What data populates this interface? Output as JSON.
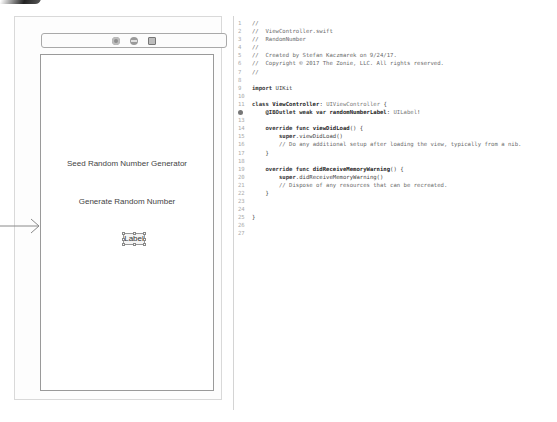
{
  "storyboard": {
    "scene_dock": {
      "icons": [
        "view-controller-icon",
        "first-responder-icon",
        "exit-icon"
      ]
    },
    "scene": {
      "buttons": [
        {
          "label": "Seed Random Number Generator"
        },
        {
          "label": "Generate Random Number"
        }
      ],
      "label": {
        "text": "Label"
      }
    },
    "entry_point": "initial-view-controller-arrow"
  },
  "editor": {
    "file_name": "ViewController.swift",
    "lines": [
      {
        "n": "1",
        "text": "//"
      },
      {
        "n": "2",
        "text": "//  ViewController.swift"
      },
      {
        "n": "3",
        "text": "//  RandomNumber"
      },
      {
        "n": "4",
        "text": "//"
      },
      {
        "n": "5",
        "text": "//  Created by Stefan Kaczmarek on 9/24/17."
      },
      {
        "n": "6",
        "text": "//  Copyright © 2017 The Zonie, LLC. All rights reserved."
      },
      {
        "n": "7",
        "text": "//"
      },
      {
        "n": "8",
        "text": ""
      },
      {
        "n": "9",
        "kw": "import",
        "rest": " UIKit"
      },
      {
        "n": "10",
        "text": ""
      },
      {
        "n": "11",
        "kw": "class",
        "name": " ViewController",
        "rest": ": ",
        "type": "UIViewController",
        "tail": " {"
      },
      {
        "n": "12",
        "outlet": true,
        "indent": "    ",
        "kw": "@IBOutlet weak var",
        "name": " randomNumberLabel",
        "rest": ": ",
        "type": "UILabel",
        "tail": "!"
      },
      {
        "n": "13",
        "text": ""
      },
      {
        "n": "14",
        "indent": "    ",
        "kw": "override func",
        "name": " viewDidLoad",
        "tail": "() {"
      },
      {
        "n": "15",
        "indent": "        ",
        "kw": "super",
        "rest": ".viewDidLoad()"
      },
      {
        "n": "16",
        "indent": "        ",
        "comment": "// Do any additional setup after loading the view, typically from a nib."
      },
      {
        "n": "17",
        "indent": "    ",
        "tail": "}"
      },
      {
        "n": "18",
        "text": ""
      },
      {
        "n": "19",
        "indent": "    ",
        "kw": "override func",
        "name": " didReceiveMemoryWarning",
        "tail": "() {"
      },
      {
        "n": "20",
        "indent": "        ",
        "kw": "super",
        "rest": ".didReceiveMemoryWarning()"
      },
      {
        "n": "21",
        "indent": "        ",
        "comment": "// Dispose of any resources that can be recreated."
      },
      {
        "n": "22",
        "indent": "    ",
        "tail": "}"
      },
      {
        "n": "23",
        "text": ""
      },
      {
        "n": "24",
        "text": ""
      },
      {
        "n": "25",
        "tail": "}"
      },
      {
        "n": "26",
        "text": ""
      },
      {
        "n": "27",
        "text": ""
      }
    ]
  }
}
